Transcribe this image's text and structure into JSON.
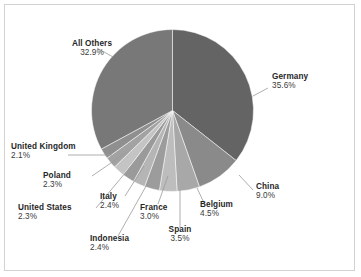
{
  "chart_data": {
    "type": "pie",
    "title": "",
    "subtitle": "",
    "xlabel": "",
    "ylabel": "",
    "legend_position": "none",
    "grid": false,
    "labels_show_percent": true,
    "start_angle_deg": 0,
    "direction": "clockwise",
    "categories": [
      "Germany",
      "China",
      "Belgium",
      "Spain",
      "France",
      "Indonesia",
      "Italy",
      "United States",
      "Poland",
      "United Kingdom",
      "All Others"
    ],
    "values": [
      35.6,
      9.0,
      4.5,
      3.5,
      3.0,
      2.4,
      2.4,
      2.3,
      2.3,
      2.1,
      32.9
    ],
    "unit": "%",
    "slices": [
      {
        "label": "Germany",
        "value": 35.6,
        "percent_text": "35.6%",
        "color": "#646464"
      },
      {
        "label": "China",
        "value": 9.0,
        "percent_text": "9.0%",
        "color": "#8a8a8a"
      },
      {
        "label": "Belgium",
        "value": 4.5,
        "percent_text": "4.5%",
        "color": "#a8a8a8"
      },
      {
        "label": "Spain",
        "value": 3.5,
        "percent_text": "3.5%",
        "color": "#bdbdbd"
      },
      {
        "label": "France",
        "value": 3.0,
        "percent_text": "3.0%",
        "color": "#9c9c9c"
      },
      {
        "label": "Indonesia",
        "value": 2.4,
        "percent_text": "2.4%",
        "color": "#b5b5b5"
      },
      {
        "label": "Italy",
        "value": 2.4,
        "percent_text": "2.4%",
        "color": "#9a9a9a"
      },
      {
        "label": "United States",
        "value": 2.3,
        "percent_text": "2.3%",
        "color": "#c4c4c4"
      },
      {
        "label": "Poland",
        "value": 2.3,
        "percent_text": "2.3%",
        "color": "#a2a2a2"
      },
      {
        "label": "United Kingdom",
        "value": 2.1,
        "percent_text": "2.1%",
        "color": "#8f8f8f"
      },
      {
        "label": "All Others",
        "value": 32.9,
        "percent_text": "32.9%",
        "color": "#787878"
      }
    ]
  },
  "labels": {
    "all_others": {
      "name": "All Others",
      "percent": "32.9%"
    },
    "germany": {
      "name": "Germany",
      "percent": "35.6%"
    },
    "china": {
      "name": "China",
      "percent": "9.0%"
    },
    "belgium": {
      "name": "Belgium",
      "percent": "4.5%"
    },
    "spain": {
      "name": "Spain",
      "percent": "3.5%"
    },
    "france": {
      "name": "France",
      "percent": "3.0%"
    },
    "indonesia": {
      "name": "Indonesia",
      "percent": "2.4%"
    },
    "italy": {
      "name": "Italy",
      "percent": "2.4%"
    },
    "united_states": {
      "name": "United States",
      "percent": "2.3%"
    },
    "poland": {
      "name": "Poland",
      "percent": "2.3%"
    },
    "united_kingdom": {
      "name": "United Kingdom",
      "percent": "2.1%"
    }
  },
  "style": {
    "background": "#ffffff",
    "border_color": "#d2d2d2",
    "leader_color": "#9a9a9a",
    "text_color": "#262626"
  }
}
